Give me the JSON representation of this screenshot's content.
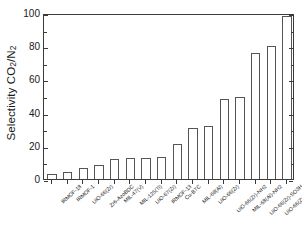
{
  "chart_data": {
    "type": "bar",
    "title": "",
    "xlabel": "",
    "ylabel": "Selectivity CO2/N2",
    "ylabel_parts": {
      "prefix": "Selectivity CO",
      "sub1": "2",
      "slash": "/N",
      "sub2": "2"
    },
    "ylim": [
      0,
      100
    ],
    "yticks": [
      0,
      20,
      40,
      60,
      80,
      100
    ],
    "ytick_labels": [
      "0",
      "20",
      "40",
      "60",
      "80",
      "100"
    ],
    "minor_yticks": [
      10,
      30,
      50,
      70,
      90
    ],
    "grid": false,
    "legend": null,
    "categories": [
      "IRMOF-18",
      "IRMOF-1",
      "UiO-66(Zr)",
      "Zr6-AzoBDC",
      "MIL-47(V)",
      "MIL-125(Ti)",
      "UiO-67(Zr)",
      "IRMOF-13",
      "Cu-BTC",
      "MIL-68(Al)",
      "UiO-66(Zr)",
      "UiO-66(Zr)-NH2",
      "MIL-68(Al)-NH2",
      "UiO-66(Zr)-SO3H",
      "UiO-66(Zr)-CO2H",
      "UiO-66(Zr)-(CO2H)2"
    ],
    "values": [
      3,
      4,
      6.5,
      8.5,
      12,
      12.5,
      12.5,
      13.5,
      21,
      31,
      32,
      48.5,
      49.5,
      76,
      80,
      98
    ]
  },
  "style": {
    "axis_color": "#3a3a3a",
    "bar_edge_color": "#555555",
    "bar_fill_color": "#ffffff",
    "background": "#ffffff",
    "text_color": "#1a1a1a"
  }
}
